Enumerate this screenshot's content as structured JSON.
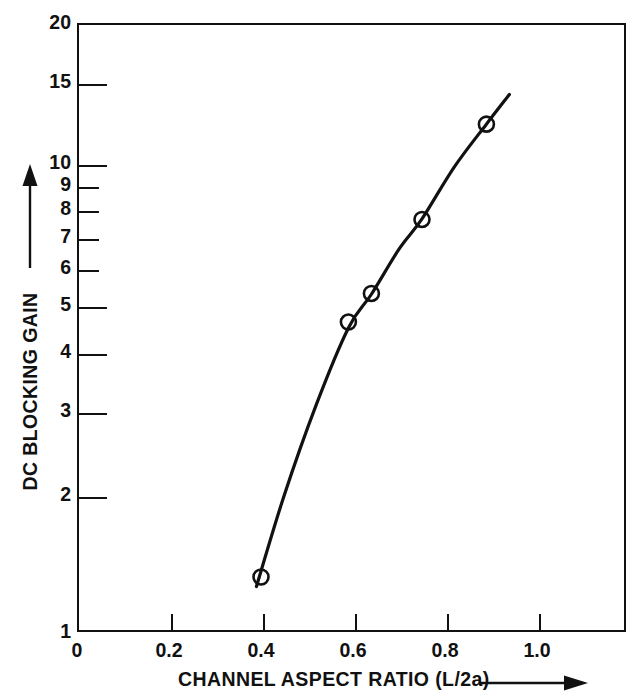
{
  "chart_data": {
    "type": "scatter",
    "title": "",
    "xlabel": "CHANNEL ASPECT RATIO (L/2a)",
    "ylabel": "DC BLOCKING GAIN",
    "xscale": "linear",
    "yscale": "log",
    "xlim": [
      0.0,
      1.193
    ],
    "ylim": [
      1,
      20
    ],
    "grid": false,
    "legend": null,
    "xticks": [
      0,
      0.2,
      0.4,
      0.6,
      0.8,
      1.0
    ],
    "xtick_labels": [
      "0",
      "0.2",
      "0.4",
      "0.6",
      "0.8",
      "1.0"
    ],
    "yticks": [
      1,
      2,
      3,
      4,
      5,
      6,
      7,
      8,
      9,
      10,
      15,
      20
    ],
    "ytick_labels": [
      "1",
      "2",
      "3",
      "4",
      "5",
      "6",
      "7",
      "8",
      "9",
      "10",
      "15",
      "20"
    ],
    "series": [
      {
        "name": "measured",
        "marker": "open-circle",
        "x": [
          0.4,
          0.59,
          0.64,
          0.75,
          0.89
        ],
        "y": [
          1.31,
          4.58,
          5.27,
          7.58,
          12.1
        ]
      },
      {
        "name": "fitted-curve",
        "marker": "none",
        "x": [
          0.39,
          0.45,
          0.52,
          0.59,
          0.64,
          0.7,
          0.75,
          0.82,
          0.89,
          0.94
        ],
        "y": [
          1.25,
          1.95,
          3.05,
          4.45,
          5.25,
          6.55,
          7.6,
          9.8,
          12.1,
          14.0
        ]
      }
    ],
    "annotations": {
      "xaxis_arrow": "right-arrow",
      "yaxis_arrow": "up-arrow"
    },
    "colors": {
      "line": "#111111",
      "marker_edge": "#111111",
      "marker_face": "#ffffff",
      "axis": "#111111",
      "background": "#ffffff"
    }
  },
  "axis": {
    "y_labels": [
      {
        "text": "20",
        "y": 23
      },
      {
        "text": "15",
        "y": 82
      },
      {
        "text": "10",
        "y": 163
      },
      {
        "text": "9",
        "y": 185
      },
      {
        "text": "8",
        "y": 209
      },
      {
        "text": "7",
        "y": 237
      },
      {
        "text": "6",
        "y": 268
      },
      {
        "text": "5",
        "y": 305
      },
      {
        "text": "4",
        "y": 352
      },
      {
        "text": "3",
        "y": 411
      },
      {
        "text": "2",
        "y": 495
      },
      {
        "text": "1",
        "y": 632
      }
    ],
    "x_labels": [
      {
        "text": "0",
        "x": 77
      },
      {
        "text": "0.2",
        "x": 169
      },
      {
        "text": "0.4",
        "x": 261
      },
      {
        "text": "0.6",
        "x": 353
      },
      {
        "text": "0.8",
        "x": 445
      },
      {
        "text": "1.0",
        "x": 537
      }
    ]
  }
}
